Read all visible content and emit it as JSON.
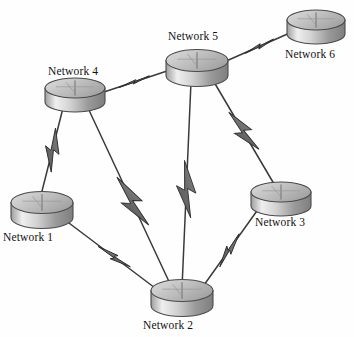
{
  "figure": {
    "kind": "network-topology-diagram",
    "clipped_title": "Figure",
    "background_color": "#fefefe",
    "node_shape": "router-disk",
    "link_style": "line-with-lightning-bolt",
    "link_semantic": "wireless-wan-link"
  },
  "palette": {
    "node_top_light": "#d8d8d8",
    "node_top_dark": "#a9a9a9",
    "node_body_light": "#e6e6e6",
    "node_body_mid": "#bcbcbc",
    "node_body_dark": "#8f8f8f",
    "node_outline": "#4a4a4a",
    "link_line": "#3a3a3a",
    "bolt_fill": "#6e6e6e",
    "bolt_outline": "#2e2e2e",
    "label_text": "#111111"
  },
  "nodes": [
    {
      "id": "network-1",
      "label": "Network 1",
      "cx": 42,
      "cy": 210,
      "rx": 31,
      "ry": 11,
      "height": 15,
      "label_x": 3,
      "label_y": 231
    },
    {
      "id": "network-2",
      "label": "Network 2",
      "cx": 182,
      "cy": 298,
      "rx": 31,
      "ry": 11,
      "height": 15,
      "label_x": 143,
      "label_y": 319
    },
    {
      "id": "network-3",
      "label": "Network 3",
      "cx": 281,
      "cy": 199,
      "rx": 30,
      "ry": 10,
      "height": 14,
      "label_x": 255,
      "label_y": 216
    },
    {
      "id": "network-4",
      "label": "Network 4",
      "cx": 75,
      "cy": 95,
      "rx": 30,
      "ry": 10,
      "height": 14,
      "label_x": 48,
      "label_y": 65
    },
    {
      "id": "network-5",
      "label": "Network 5",
      "cx": 197,
      "cy": 68,
      "rx": 31,
      "ry": 11,
      "height": 15,
      "label_x": 168,
      "label_y": 30
    },
    {
      "id": "network-6",
      "label": "Network 6",
      "cx": 316,
      "cy": 27,
      "rx": 29,
      "ry": 10,
      "height": 14,
      "label_x": 285,
      "label_y": 48
    }
  ],
  "links": [
    {
      "id": "link-n4-n5",
      "from": "network-4",
      "to": "network-5",
      "x1": 104,
      "y1": 92,
      "x2": 170,
      "y2": 70,
      "bolt_t": 0.46,
      "bolt_size": 17,
      "bolt_squash": 0.3
    },
    {
      "id": "link-n5-n6",
      "from": "network-5",
      "to": "network-6",
      "x1": 224,
      "y1": 62,
      "x2": 292,
      "y2": 32,
      "bolt_t": 0.52,
      "bolt_size": 17,
      "bolt_squash": 0.38
    },
    {
      "id": "link-n4-n1",
      "from": "network-4",
      "to": "network-1",
      "x1": 63,
      "y1": 108,
      "x2": 40,
      "y2": 199,
      "bolt_t": 0.46,
      "bolt_size": 23,
      "bolt_squash": 1.0
    },
    {
      "id": "link-n4-n2",
      "from": "network-4",
      "to": "network-2",
      "x1": 88,
      "y1": 108,
      "x2": 172,
      "y2": 288,
      "bolt_t": 0.52,
      "bolt_size": 30,
      "bolt_squash": 1.0
    },
    {
      "id": "link-n5-n2",
      "from": "network-5",
      "to": "network-2",
      "x1": 191,
      "y1": 82,
      "x2": 182,
      "y2": 288,
      "bolt_t": 0.52,
      "bolt_size": 30,
      "bolt_squash": 1.0
    },
    {
      "id": "link-n5-n3",
      "from": "network-5",
      "to": "network-3",
      "x1": 214,
      "y1": 82,
      "x2": 277,
      "y2": 189,
      "bolt_t": 0.46,
      "bolt_size": 25,
      "bolt_squash": 1.0
    },
    {
      "id": "link-n1-n2",
      "from": "network-1",
      "to": "network-2",
      "x1": 65,
      "y1": 220,
      "x2": 163,
      "y2": 294,
      "bolt_t": 0.5,
      "bolt_size": 20,
      "bolt_squash": 0.55
    },
    {
      "id": "link-n3-n2",
      "from": "network-3",
      "to": "network-2",
      "x1": 259,
      "y1": 208,
      "x2": 199,
      "y2": 292,
      "bolt_t": 0.5,
      "bolt_size": 20,
      "bolt_squash": 0.62
    }
  ]
}
